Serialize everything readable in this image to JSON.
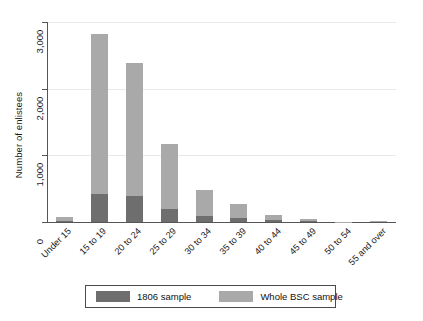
{
  "chart_data": {
    "type": "bar",
    "subtype": "stacked",
    "title": "",
    "xlabel": "",
    "ylabel": "Number of enlistees",
    "ylim": [
      0,
      3000
    ],
    "yticks": [
      0,
      1000,
      2000,
      3000
    ],
    "ytick_labels": [
      "0",
      "1,000",
      "2,000",
      "3,000"
    ],
    "grid": true,
    "legend_position": "bottom",
    "categories": [
      "Under 15",
      "15 to 19",
      "20 to 24",
      "25 to 29",
      "30 to 34",
      "35 to 39",
      "40 to 44",
      "45 to 49",
      "50 to 54",
      "55 and over"
    ],
    "series": [
      {
        "name": "1806 sample",
        "color": "#6e6e6e",
        "values": [
          10,
          420,
          390,
          195,
          95,
          55,
          25,
          10,
          0,
          0
        ]
      },
      {
        "name": "Whole BSC sample",
        "color": "#a9a9a9",
        "values": [
          70,
          2820,
          2380,
          1165,
          480,
          265,
          110,
          40,
          5,
          15
        ]
      }
    ]
  },
  "legend": {
    "entries": [
      {
        "label": "1806 sample",
        "color": "#6e6e6e"
      },
      {
        "label": "Whole BSC sample",
        "color": "#a9a9a9"
      }
    ]
  },
  "axis": {
    "y_title": "Number of enlistees"
  }
}
